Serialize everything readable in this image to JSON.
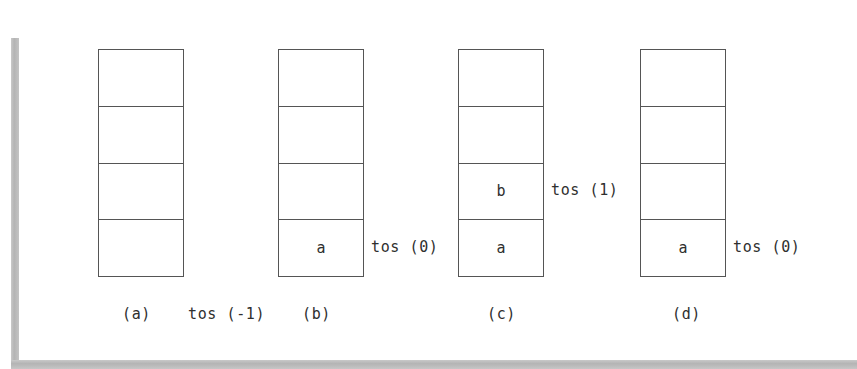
{
  "figure": {
    "cells_per_stack": 4,
    "colors": {
      "background": "#ffffff",
      "stroke": "#555555",
      "text": "#2f2f2f",
      "rail": "#b4b4b4"
    }
  },
  "stacks": [
    {
      "id": "a",
      "caption": "(a)",
      "tos_label": "tos (-1)",
      "tos_row": 3,
      "cells": [
        "",
        "",
        "",
        ""
      ]
    },
    {
      "id": "b",
      "caption": "(b)",
      "tos_label": "tos (0)",
      "tos_row": 3,
      "cells": [
        "",
        "",
        "",
        "a"
      ]
    },
    {
      "id": "c",
      "caption": "(c)",
      "tos_label": "tos (1)",
      "tos_row": 2,
      "cells": [
        "",
        "",
        "b",
        "a"
      ]
    },
    {
      "id": "d",
      "caption": "(d)",
      "tos_label": "tos (0)",
      "tos_row": 3,
      "cells": [
        "",
        "",
        "",
        "a"
      ]
    }
  ]
}
